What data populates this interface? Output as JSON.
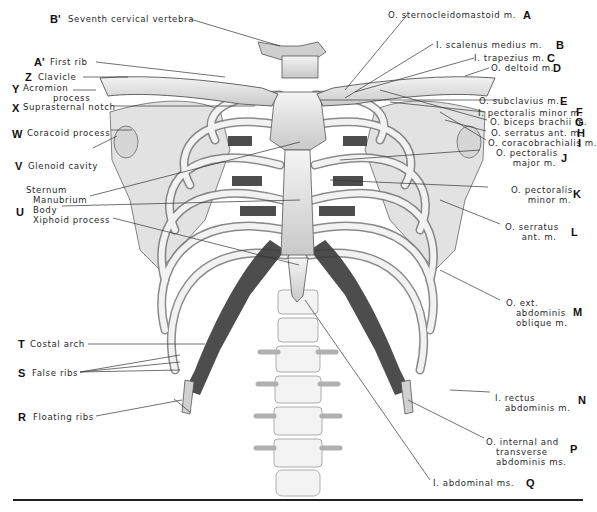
{
  "figure": {
    "left_labels": [
      {
        "letter": "B'",
        "text": "Seventh cervical vertebra"
      },
      {
        "letter": "A'",
        "text": "First rib"
      },
      {
        "letter": "Z",
        "text": "Clavicle"
      },
      {
        "letter": "Y",
        "text": "Acromion\n         process"
      },
      {
        "letter": "X",
        "text": "Suprasternal notch"
      },
      {
        "letter": "W",
        "text": "Coracoid process"
      },
      {
        "letter": "V",
        "text": "Glenoid cavity"
      },
      {
        "letter": "U",
        "text_heading": "Sternum",
        "text_parts": [
          "Manubrium",
          "Body",
          "Xiphoid process"
        ]
      },
      {
        "letter": "T",
        "text": "Costal arch"
      },
      {
        "letter": "S",
        "text": "False ribs"
      },
      {
        "letter": "R",
        "text": "Floating ribs"
      }
    ],
    "right_labels": [
      {
        "letter": "A",
        "text": "O. sternocleidomastoid m."
      },
      {
        "letter": "B",
        "text": "I. scalenus medius m."
      },
      {
        "letter": "C",
        "text": "I. trapezius m."
      },
      {
        "letter": "D",
        "text": "O. deltoid m."
      },
      {
        "letter": "E",
        "text": "O. subclavius m."
      },
      {
        "letter": "F",
        "text": "I. pectoralis minor m."
      },
      {
        "letter": "G",
        "text": "O. biceps brachii m."
      },
      {
        "letter": "H",
        "text": "O. serratus ant. m."
      },
      {
        "letter": "I",
        "text": "O. coracobrachialis m."
      },
      {
        "letter": "J",
        "text": "O. pectoralis\n     major m."
      },
      {
        "letter": "K",
        "text": "O. pectoralis\n     minor m."
      },
      {
        "letter": "L",
        "text": "O. serratus\n     ant. m."
      },
      {
        "letter": "M",
        "text": "O. ext.\n   abdominis\n   oblique m."
      },
      {
        "letter": "N",
        "text": "I. rectus\n   abdominis m."
      },
      {
        "letter": "P",
        "text": "O. internal and\n   transverse\n   abdominis ms."
      },
      {
        "letter": "Q",
        "text": "I. abdominal ms."
      }
    ],
    "colors": {
      "ink": "#222222",
      "bone": "#e4e4e4",
      "muscle_attachment": "#3a3a3a",
      "background": "#ffffff"
    }
  }
}
